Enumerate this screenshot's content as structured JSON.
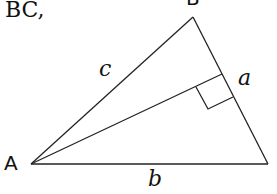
{
  "header_text": "BC,",
  "vertices": {
    "A": {
      "label": "A",
      "x": 31,
      "y": 164
    },
    "B": {
      "label": "B",
      "x": 193,
      "y": 17
    },
    "C": {
      "x": 268,
      "y": 164
    }
  },
  "sides": {
    "a": "a",
    "b": "b",
    "c": "c"
  },
  "altitude": {
    "from": "A",
    "foot_x": 222,
    "foot_y": 74
  },
  "colors": {
    "stroke": "#222222",
    "text": "#111111",
    "background": "#ffffff"
  }
}
